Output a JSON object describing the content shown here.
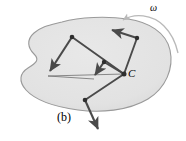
{
  "figure": {
    "panel_label": "(b)",
    "caption_kind": "rigid-body-velocity-diagram",
    "width": 186,
    "height": 141
  },
  "labels": {
    "center_point": "C",
    "angular_velocity": "ω"
  },
  "colors": {
    "body_fill": "#e3e3e3",
    "body_stroke": "#9a9a9a",
    "vector_stroke": "#4a4a4a",
    "thin_line": "#6f6f6f",
    "arc_stroke": "#b9b9b9",
    "text": "#000000",
    "background": "#ffffff"
  },
  "geometry": {
    "center": {
      "x": 124,
      "y": 74,
      "name": "C"
    },
    "body_outline_path": "M 62,22 C 80,17 106,16 128,19 C 148,22 166,32 170,50 C 174,68 166,88 148,99 C 128,111 100,113 78,110 C 56,107 36,101 26,90 C 18,81 20,73 28,68 C 36,63 40,60 34,54 C 28,48 26,40 34,33 C 42,26 50,25 62,22 Z",
    "points": [
      {
        "name": "node-upper-left",
        "x": 72,
        "y": 37
      },
      {
        "name": "node-middle",
        "x": 104,
        "y": 62
      },
      {
        "name": "node-upper-right",
        "x": 137,
        "y": 38
      },
      {
        "name": "node-lower-left",
        "x": 85,
        "y": 100
      }
    ],
    "spokes": [
      {
        "name": "spoke-to-upper-left",
        "x1": 124,
        "y1": 74,
        "x2": 72,
        "y2": 37
      },
      {
        "name": "spoke-to-middle",
        "x1": 124,
        "y1": 74,
        "x2": 104,
        "y2": 62
      },
      {
        "name": "spoke-to-upper-right",
        "x1": 124,
        "y1": 74,
        "x2": 137,
        "y2": 38
      },
      {
        "name": "spoke-to-lower-left",
        "x1": 124,
        "y1": 74,
        "x2": 85,
        "y2": 100
      }
    ],
    "velocity_vectors": [
      {
        "name": "vector-upper-left",
        "x1": 72,
        "y1": 37,
        "x2": 48,
        "y2": 73
      },
      {
        "name": "vector-middle",
        "x1": 104,
        "y1": 62,
        "x2": 94,
        "y2": 77
      },
      {
        "name": "vector-upper-right",
        "x1": 137,
        "y1": 38,
        "x2": 110,
        "y2": 29
      },
      {
        "name": "vector-lower-left",
        "x1": 85,
        "y1": 100,
        "x2": 100,
        "y2": 133
      }
    ],
    "thin_chords": [
      {
        "name": "chord-left-to-center",
        "x1": 48,
        "y1": 76,
        "x2": 124,
        "y2": 74
      },
      {
        "name": "chord-left-to-lower",
        "x1": 48,
        "y1": 76,
        "x2": 94,
        "y2": 79
      }
    ],
    "rotation_arc": {
      "name": "angular-velocity-arc",
      "path": "M 122,20 C 134,13 152,14 164,26 C 172,34 176,44 178,53",
      "arrow_tip": {
        "x": 122,
        "y": 20
      },
      "direction": "counterclockwise"
    }
  }
}
